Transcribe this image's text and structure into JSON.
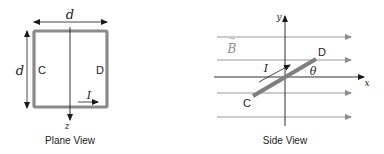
{
  "colors": {
    "loop": "#8a8a8a",
    "axis": "#1a1a1a",
    "field_lines": "#8c8c8c",
    "rod": "#7f7f7f",
    "text": "#222222"
  },
  "plane_view": {
    "caption": "Plane View",
    "width_label": "d",
    "height_label": "d",
    "side_left_label": "C",
    "side_right_label": "D",
    "current_label": "I",
    "axis_label": "z"
  },
  "side_view": {
    "caption": "Side View",
    "field_label": "B",
    "field_vector_mark": "→",
    "current_label": "I",
    "end_c_label": "C",
    "end_d_label": "D",
    "angle_label": "θ",
    "x_axis_label": "x",
    "y_axis_label": "y",
    "field_line_count": 5
  }
}
